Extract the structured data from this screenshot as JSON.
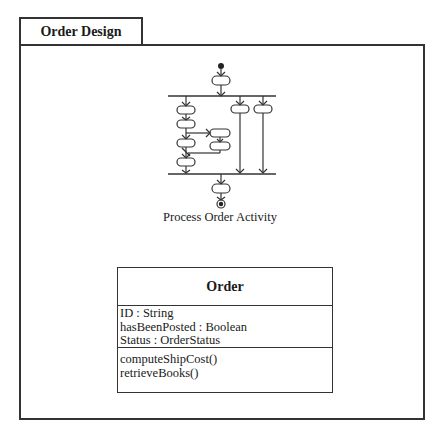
{
  "package": {
    "name": "Order Design"
  },
  "activity": {
    "caption": "Process Order Activity",
    "nodes": {
      "initial": "initial-node",
      "final": "final-node",
      "fork_bar": "fork",
      "join_bar": "join"
    }
  },
  "class": {
    "name": "Order",
    "attributes": [
      "ID : String",
      "hasBeenPosted : Boolean",
      "Status : OrderStatus"
    ],
    "operations": [
      "computeShipCost()",
      "retrieveBooks()"
    ]
  },
  "colors": {
    "line": "#333333",
    "background": "#ffffff"
  }
}
